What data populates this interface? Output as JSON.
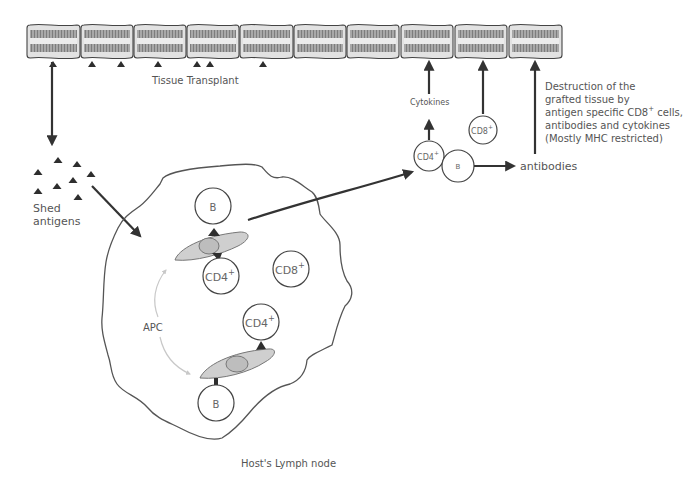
{
  "diagram": {
    "colors": {
      "stroke": "#333333",
      "text": "#555555",
      "membrane_fill": "#e2e2e2",
      "membrane_band": "#9a9a9a",
      "apc_fill": "#cfcfcf",
      "antigen": "#2e2e2e"
    },
    "labels": {
      "tissue_transplant": "Tissue Transplant",
      "shed_antigens_line1": "Shed",
      "shed_antigens_line2": "antigens",
      "apc": "APC",
      "lymph_node": "Host's Lymph node",
      "cytokines": "Cytokines",
      "antibodies": "antibodies",
      "destruction": [
        "Destruction of the",
        "grafted tissue by",
        "antigen specific CD8",
        "antibodies and cytokines",
        "(Mostly MHC restricted)"
      ],
      "destruction_sup": "+",
      "destruction_suffix": " cells,"
    },
    "membrane_segments": [
      {
        "x": 27,
        "w": 53
      },
      {
        "x": 81,
        "w": 52
      },
      {
        "x": 134,
        "w": 52
      },
      {
        "x": 187,
        "w": 52
      },
      {
        "x": 240,
        "w": 53
      },
      {
        "x": 294,
        "w": 52
      },
      {
        "x": 347,
        "w": 52
      },
      {
        "x": 401,
        "w": 52
      },
      {
        "x": 455,
        "w": 52
      },
      {
        "x": 509,
        "w": 53
      }
    ],
    "membrane_antigens_x": [
      53,
      92,
      121,
      158,
      197,
      210,
      263
    ],
    "shed_antigens": [
      {
        "x": 58,
        "y": 160
      },
      {
        "x": 77,
        "y": 164
      },
      {
        "x": 38,
        "y": 172
      },
      {
        "x": 91,
        "y": 174
      },
      {
        "x": 73,
        "y": 180
      },
      {
        "x": 57,
        "y": 186
      },
      {
        "x": 38,
        "y": 191
      },
      {
        "x": 78,
        "y": 197
      }
    ],
    "cells": {
      "lymph_b_top": {
        "label": "B",
        "sup": "",
        "cx": 213,
        "cy": 206,
        "r": 18
      },
      "lymph_cd4_top": {
        "label": "CD4",
        "sup": "+",
        "cx": 221,
        "cy": 276,
        "r": 18
      },
      "lymph_cd8": {
        "label": "CD8",
        "sup": "+",
        "cx": 291,
        "cy": 269,
        "r": 18
      },
      "lymph_cd4_bottom": {
        "label": "CD4",
        "sup": "+",
        "cx": 261,
        "cy": 322,
        "r": 18
      },
      "lymph_b_bottom": {
        "label": "B",
        "sup": "",
        "cx": 216,
        "cy": 403,
        "r": 18
      },
      "effector_cd4": {
        "label": "CD4",
        "sup": "+",
        "cx": 429,
        "cy": 156,
        "r": 15
      },
      "effector_b": {
        "label": "B",
        "sup": "",
        "cx": 458,
        "cy": 166,
        "r": 16
      },
      "effector_cd8": {
        "label": "CD8",
        "sup": "+",
        "cx": 483,
        "cy": 130,
        "r": 14
      }
    }
  }
}
